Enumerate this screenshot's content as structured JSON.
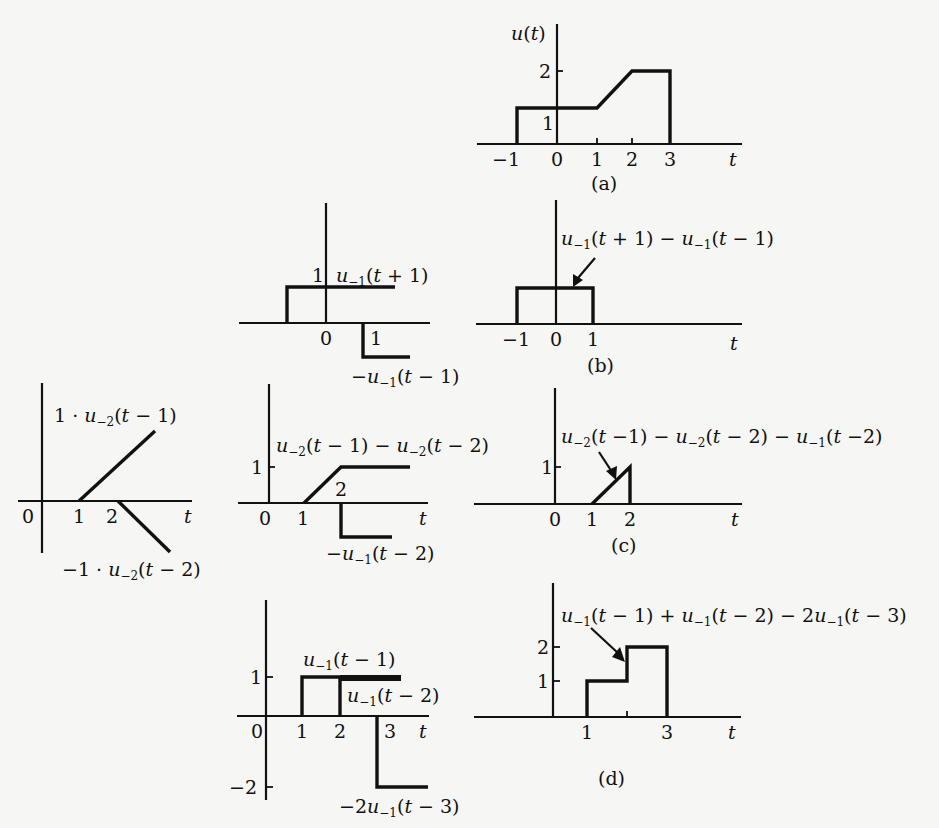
{
  "figure": {
    "type": "signal-decomposition-diagram",
    "independent_variable": "t",
    "panels": {
      "a": {
        "caption": "(a)",
        "ylabel": "u(t)",
        "x_ticks": [
          "−1",
          "0",
          "1",
          "2",
          "3"
        ],
        "y_ticks": [
          "1",
          "2"
        ],
        "xlabel": "t",
        "signal_points": [
          [
            -1,
            0
          ],
          [
            -1,
            1
          ],
          [
            1,
            1
          ],
          [
            2,
            2
          ],
          [
            3,
            2
          ],
          [
            3,
            0
          ]
        ]
      },
      "b_left": {
        "labels": {
          "upper": "u₋₁(t + 1)",
          "lower": "−u₋₁(t − 1)"
        },
        "x_ticks": [
          "0",
          "1"
        ],
        "y_ticks": [
          "1"
        ]
      },
      "b_right": {
        "caption": "(b)",
        "label": "u₋₁(t + 1) − u₋₁(t − 1)",
        "x_ticks": [
          "−1",
          "0",
          "1"
        ],
        "xlabel": "t",
        "signal_points": [
          [
            -1,
            0
          ],
          [
            -1,
            1
          ],
          [
            1,
            1
          ],
          [
            1,
            0
          ]
        ]
      },
      "c_left": {
        "labels": {
          "upper": "1 · u₋₂(t − 1)",
          "lower": "−1 · u₋₂(t − 2)"
        },
        "x_ticks": [
          "0",
          "1",
          "2"
        ],
        "xlabel": "t"
      },
      "c_mid": {
        "labels": {
          "upper": "u₋₂(t − 1) − u₋₂(t − 2)",
          "lower": "−u₋₁(t − 2)"
        },
        "x_ticks": [
          "0",
          "1",
          "2"
        ],
        "y_ticks": [
          "1"
        ],
        "xlabel": "t"
      },
      "c_right": {
        "caption": "(c)",
        "label": "u₋₂(t −1) − u₋₂(t − 2) − u₋₁(t −2)",
        "x_ticks": [
          "0",
          "1",
          "2"
        ],
        "y_ticks": [
          "1"
        ],
        "xlabel": "t",
        "signal_points": [
          [
            1,
            0
          ],
          [
            2,
            1
          ],
          [
            2,
            0
          ]
        ]
      },
      "d_left": {
        "labels": {
          "a": "u₋₁(t − 1)",
          "b": "u₋₁(t − 2)",
          "c": "−2u₋₁(t − 3)"
        },
        "x_ticks": [
          "0",
          "1",
          "2",
          "3"
        ],
        "y_ticks": [
          "1",
          "−2"
        ],
        "xlabel": "t"
      },
      "d_right": {
        "caption": "(d)",
        "label": "u₋₁(t − 1) + u₋₁(t − 2) − 2u₋₁(t − 3)",
        "x_ticks": [
          "1",
          "3"
        ],
        "y_ticks": [
          "1",
          "2"
        ],
        "xlabel": "t",
        "signal_points": [
          [
            1,
            0
          ],
          [
            1,
            1
          ],
          [
            2,
            1
          ],
          [
            2,
            2
          ],
          [
            3,
            2
          ],
          [
            3,
            0
          ]
        ]
      }
    }
  }
}
